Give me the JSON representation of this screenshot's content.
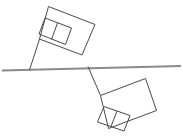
{
  "figure": {
    "canvas": {
      "width": 183,
      "height": 140,
      "background": "#ffffff"
    },
    "colors": {
      "outline": "#4a4a4a",
      "baseline": "#8a8a8a",
      "background": "#ffffff"
    },
    "baseline": {
      "label": "ground-line",
      "x1": 2,
      "y1": 70.5,
      "x2": 181,
      "y2": 66.0,
      "stroke": "#8a8a8a",
      "stroke_width": 2
    },
    "upper_flag": {
      "label": "upper-flag",
      "pole": {
        "x1": 29.5,
        "y1": 70.0,
        "x2": 39.5,
        "y2": 39.0
      },
      "banner_points": "48.5,6.5 95.0,24.5 82.0,55.0 39.5,39.0",
      "inner_rect_points": "45.0,18.0 71.5,28.0 65.5,44.5 39.0,34.0",
      "inner_divider": "57.5,23.0 51.5,39.5",
      "rotation_note": "tilted up-right"
    },
    "lower_flag": {
      "label": "lower-flag",
      "pole": {
        "x1": 88.0,
        "y1": 66.5,
        "x2": 100.5,
        "y2": 95.5
      },
      "banner_points": "100.5,95.5 145.5,78.5 156.5,110.5 108.5,128.5",
      "inner_rect_points": "104.0,106.5 130.0,115.5 124.0,131.0 97.5,122.0",
      "inner_divider": "117.0,111.0 111.0,126.5",
      "rotation_note": "tilted down-right, 180-degree rotation of upper flag"
    }
  },
  "accessibility": {
    "alt_text": "A horizontal line with a tilted rectangular flag above the line on the left and a congruent tilted rectangular flag below the line on the right, each attached by a short pole to the line."
  }
}
